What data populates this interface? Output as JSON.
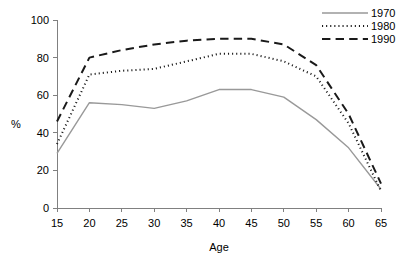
{
  "chart_data": {
    "type": "line",
    "title": "",
    "subtitle": "",
    "xlabel": "Age",
    "ylabel": "%",
    "x": [
      15,
      20,
      25,
      30,
      35,
      40,
      45,
      50,
      55,
      60,
      65
    ],
    "xlim": [
      15,
      65
    ],
    "ylim": [
      0,
      100
    ],
    "xticks": [
      "15",
      "20",
      "25",
      "30",
      "35",
      "40",
      "45",
      "50",
      "55",
      "60",
      "65"
    ],
    "yticks": [
      "0",
      "20",
      "40",
      "60",
      "80",
      "100"
    ],
    "grid": false,
    "legend_position": "top-right",
    "series": [
      {
        "name": "1970",
        "color": "#999999",
        "style": "solid",
        "width": 1.4,
        "values": [
          29,
          56,
          55,
          53,
          57,
          63,
          63,
          59,
          47,
          32,
          10
        ]
      },
      {
        "name": "1980",
        "color": "#1a1a1a",
        "style": "dotted",
        "width": 2.0,
        "values": [
          34,
          71,
          73,
          74,
          78,
          82,
          82,
          78,
          70,
          45,
          9
        ]
      },
      {
        "name": "1990",
        "color": "#1a1a1a",
        "style": "dashed",
        "width": 2.0,
        "values": [
          46,
          80,
          84,
          87,
          89,
          90,
          90,
          87,
          76,
          50,
          13
        ]
      }
    ]
  },
  "axes": {
    "y_axis_title": "%",
    "x_axis_title": "Age"
  },
  "legend": {
    "entries": [
      {
        "label": "1970"
      },
      {
        "label": "1980"
      },
      {
        "label": "1990"
      }
    ]
  }
}
